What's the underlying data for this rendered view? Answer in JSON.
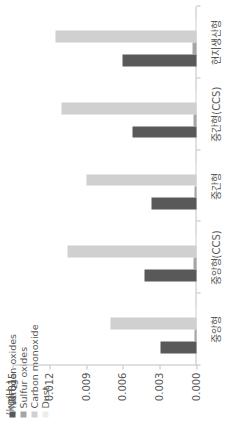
{
  "chart_data": {
    "type": "bar",
    "orientation": "vertical",
    "title": "",
    "xlabel": "",
    "ylabel": "(kg/H2)",
    "unit_label_main": "(kg/H",
    "unit_label_sub": "2",
    "unit_label_tail": ")",
    "ylim": [
      0.0,
      0.015
    ],
    "ytick_labels": [
      "0.000",
      "0.003",
      "0.006",
      "0.009",
      "0.012",
      "0.015"
    ],
    "ytick_values": [
      0.0,
      0.003,
      0.006,
      0.009,
      0.012,
      0.015
    ],
    "grid": false,
    "legend_position": "top-left",
    "categories": [
      "중앙형",
      "중앙형(CCS)",
      "중간형",
      "중간형(CCS)",
      "현지생산형"
    ],
    "series": [
      {
        "name": "Nitrogen oxides",
        "color": "#595959",
        "values": [
          0.0029,
          0.0042,
          0.0037,
          0.0052,
          0.006
        ]
      },
      {
        "name": "Sulfur oxides",
        "color": "#a6a6a6",
        "values": [
          0.0002,
          0.00025,
          0.0002,
          0.00025,
          0.0003
        ]
      },
      {
        "name": "Carbon monoxide",
        "color": "#d0d0d0",
        "values": [
          0.007,
          0.0105,
          0.009,
          0.011,
          0.0115
        ]
      },
      {
        "name": "Dust",
        "color": "#ededed",
        "values": [
          0.00012,
          0.00012,
          0.00012,
          0.00012,
          0.00012
        ]
      }
    ]
  },
  "legend": {
    "items": [
      {
        "label": "Nitrogen oxides",
        "color": "#595959"
      },
      {
        "label": "Sulfur oxides",
        "color": "#a6a6a6"
      },
      {
        "label": "Carbon monoxide",
        "color": "#d0d0d0"
      },
      {
        "label": "Dust",
        "color": "#ededed"
      }
    ]
  }
}
